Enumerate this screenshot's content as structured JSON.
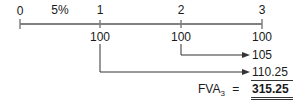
{
  "diagram": {
    "type": "cash-flow-timeline",
    "rate_label": "5%",
    "periods": [
      "0",
      "1",
      "2",
      "3"
    ],
    "cash_flows": [
      {
        "period": "1",
        "amount": "100"
      },
      {
        "period": "2",
        "amount": "100"
      },
      {
        "period": "3",
        "amount": "100"
      }
    ],
    "compounded_values": [
      {
        "from_period": "2",
        "value": "105"
      },
      {
        "from_period": "1",
        "value": "110.25"
      }
    ],
    "period3_value": "100",
    "result": {
      "label_main": "FVA",
      "label_sub": "3",
      "equals": "=",
      "value": "315.25"
    },
    "colors": {
      "axis": "#808080",
      "text": "#1a1a1a",
      "arrow": "#333333"
    }
  }
}
